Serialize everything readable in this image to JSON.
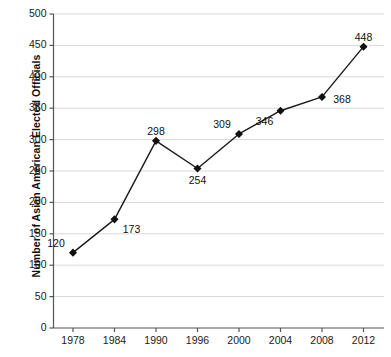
{
  "chart_data": {
    "type": "line",
    "title": "",
    "xlabel": "",
    "ylabel": "Number of Asian American Elected Officials",
    "categories": [
      "1978",
      "1984",
      "1990",
      "1996",
      "2000",
      "2004",
      "2008",
      "2012"
    ],
    "values": [
      120,
      173,
      298,
      254,
      309,
      346,
      368,
      448
    ],
    "point_labels": [
      "120",
      "173",
      "298",
      "254",
      "309",
      "346",
      "368",
      "448"
    ],
    "label_positions": [
      "above-left",
      "below-right",
      "above",
      "below",
      "above-left",
      "below-left",
      "right",
      "above"
    ],
    "ylim": [
      0,
      500
    ],
    "ytick_labels": [
      "0",
      "50",
      "100",
      "150",
      "200",
      "250",
      "300",
      "350",
      "400",
      "450",
      "500"
    ],
    "ytick_values": [
      0,
      50,
      100,
      150,
      200,
      250,
      300,
      350,
      400,
      450,
      500
    ],
    "grid": true,
    "grid_axis": "y",
    "legend": false,
    "legend_position": "none",
    "series_color": "#1a1a1a",
    "marker": "diamond",
    "marker_color": "#111111",
    "grid_color": "#d9d9d9",
    "axis_color": "#555555",
    "background_color": "#ffffff"
  }
}
